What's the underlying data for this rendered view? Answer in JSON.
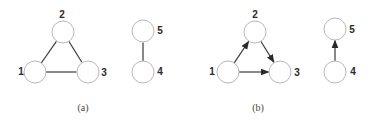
{
  "style": {
    "node_stroke": "#b8b8b8",
    "node_fill": "#ffffff",
    "edge_color": "#3a3a3a",
    "label_color": "#2a2a2a",
    "node_radius": 11
  },
  "graphs": [
    {
      "id": "a",
      "caption": "(a)",
      "directed": false,
      "caption_pos": [
        83,
        109
      ],
      "nodes": [
        {
          "id": "1",
          "label": "1",
          "cx": 35,
          "cy": 72,
          "lx": 21,
          "ly": 72
        },
        {
          "id": "2",
          "label": "2",
          "cx": 63,
          "cy": 32,
          "lx": 62,
          "ly": 15
        },
        {
          "id": "3",
          "label": "3",
          "cx": 88,
          "cy": 72,
          "lx": 104,
          "ly": 73
        },
        {
          "id": "4",
          "label": "4",
          "cx": 143,
          "cy": 72,
          "lx": 160,
          "ly": 72
        },
        {
          "id": "5",
          "label": "5",
          "cx": 143,
          "cy": 31,
          "lx": 160,
          "ly": 31
        }
      ],
      "edges": [
        {
          "from": "1",
          "to": "2"
        },
        {
          "from": "2",
          "to": "3"
        },
        {
          "from": "1",
          "to": "3"
        },
        {
          "from": "4",
          "to": "5"
        }
      ]
    },
    {
      "id": "b",
      "caption": "(b)",
      "directed": true,
      "caption_pos": [
        258,
        109
      ],
      "nodes": [
        {
          "id": "1",
          "label": "1",
          "cx": 228,
          "cy": 72,
          "lx": 212,
          "ly": 72
        },
        {
          "id": "2",
          "label": "2",
          "cx": 255,
          "cy": 32,
          "lx": 255,
          "ly": 15
        },
        {
          "id": "3",
          "label": "3",
          "cx": 280,
          "cy": 72,
          "lx": 297,
          "ly": 73
        },
        {
          "id": "4",
          "label": "4",
          "cx": 335,
          "cy": 72,
          "lx": 353,
          "ly": 72
        },
        {
          "id": "5",
          "label": "5",
          "cx": 335,
          "cy": 29,
          "lx": 352,
          "ly": 30
        }
      ],
      "edges": [
        {
          "from": "1",
          "to": "2"
        },
        {
          "from": "2",
          "to": "3"
        },
        {
          "from": "1",
          "to": "3"
        },
        {
          "from": "4",
          "to": "5"
        }
      ]
    }
  ]
}
